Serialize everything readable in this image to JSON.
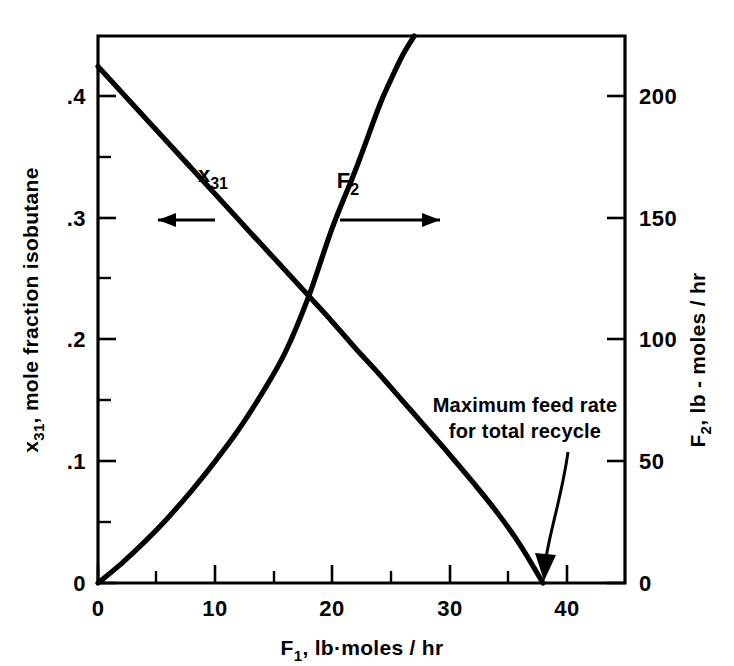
{
  "figure": {
    "background_color": "#ffffff",
    "ink_color": "#000000"
  },
  "axes": {
    "x": {
      "title_main": "F",
      "title_sub": "1",
      "title_rest": ",  lb·moles / hr",
      "tick_labels": [
        "0",
        "10",
        "20",
        "30",
        "40"
      ],
      "tick_values": [
        0,
        10,
        20,
        30,
        40
      ],
      "minor_tick_values": [
        5,
        15,
        25,
        35
      ],
      "range": [
        0,
        45
      ]
    },
    "y_left": {
      "title_main": "x",
      "title_sub": "31",
      "title_rest": ", mole fraction isobutane",
      "tick_labels": [
        "0",
        ".1",
        ".2",
        ".3",
        ".4"
      ],
      "tick_values": [
        0,
        0.1,
        0.2,
        0.3,
        0.4
      ],
      "minor_tick_values": [
        0.05,
        0.15,
        0.25,
        0.35
      ],
      "range": [
        0,
        0.45
      ]
    },
    "y_right": {
      "title_main": "F",
      "title_sub": "2",
      "title_rest": ",  lb - moles / hr",
      "tick_labels": [
        "0",
        "50",
        "100",
        "150",
        "200"
      ],
      "tick_values": [
        0,
        50,
        100,
        150,
        200
      ],
      "minor_tick_values": [],
      "range": [
        0,
        225
      ]
    }
  },
  "curve_labels": {
    "x31": {
      "main": "x",
      "sub": "31"
    },
    "f2": {
      "main": "F",
      "sub": "2"
    }
  },
  "annotation": {
    "line1": "Maximum feed rate",
    "line2": "for total recycle"
  },
  "chart_data": {
    "type": "line",
    "title": "",
    "xlabel": "F1, lb·moles/hr",
    "ylabel": "x31, mole fraction isobutane",
    "y2label": "F2, lb-moles/hr",
    "xlim": [
      0,
      45
    ],
    "ylim": [
      0,
      0.45
    ],
    "y2lim": [
      0,
      225
    ],
    "grid": false,
    "legend": "inline-curve-labels",
    "series": [
      {
        "name": "x31",
        "axis": "left",
        "label": "x31",
        "pointer_direction": "left",
        "x": [
          0,
          2,
          4,
          6,
          8,
          10,
          12,
          14,
          16,
          18,
          20,
          22,
          24,
          26,
          28,
          30,
          32,
          34,
          36,
          38
        ],
        "y": [
          0.425,
          0.404,
          0.383,
          0.362,
          0.341,
          0.32,
          0.299,
          0.278,
          0.257,
          0.236,
          0.215,
          0.193,
          0.172,
          0.15,
          0.128,
          0.106,
          0.083,
          0.059,
          0.032,
          0.0
        ]
      },
      {
        "name": "F2",
        "axis": "right",
        "label": "F2",
        "pointer_direction": "right",
        "x": [
          0,
          2,
          4,
          6,
          8,
          10,
          12,
          14,
          16,
          18,
          20,
          22,
          24,
          25,
          26,
          27
        ],
        "y": [
          0,
          8,
          17,
          27,
          38,
          50,
          63,
          78,
          95,
          118,
          146,
          170,
          196,
          207,
          217,
          225
        ]
      }
    ],
    "annotations": [
      {
        "text": "Maximum feed rate for total recycle",
        "points_to_x": 38,
        "points_to_y": 0
      }
    ],
    "notes": {
      "crossover_x": 20,
      "crossover_x31": 0.215,
      "crossover_F2": 146,
      "max_feed_rate": 38
    }
  }
}
